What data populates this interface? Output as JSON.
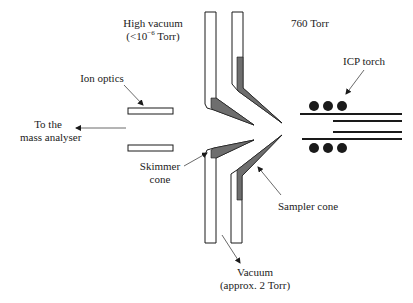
{
  "diagram": {
    "labels": {
      "high_vacuum_line1": "High vacuum",
      "high_vacuum_line2_prefix": "(<10",
      "high_vacuum_exponent": "−6",
      "high_vacuum_line2_suffix": " Torr)",
      "atmospheric": "760 Torr",
      "ion_optics": "Ion optics",
      "to_mass_analyser_line1": "To the",
      "to_mass_analyser_line2": "mass analyser",
      "icp_torch": "ICP torch",
      "skimmer_line1": "Skimmer",
      "skimmer_line2": "cone",
      "sampler_cone": "Sampler cone",
      "vacuum_line1": "Vacuum",
      "vacuum_line2": "(approx. 2 Torr)"
    },
    "colors": {
      "line": "#1a1a1a",
      "insert": "#6e6e6e",
      "plate_fill": "#ffffff"
    }
  }
}
